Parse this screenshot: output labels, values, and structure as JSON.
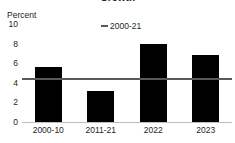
{
  "figure": {
    "title_partial": "Growth",
    "axis_unit_label": "Percent",
    "legend": [
      {
        "label": "2000-21",
        "marker": "horizontal-line-marker",
        "color": "#58595b"
      }
    ]
  },
  "chart_data": {
    "type": "bar",
    "title": "Growth",
    "xlabel": "",
    "ylabel": "Percent",
    "ylim": [
      0,
      10
    ],
    "yticks": [
      0,
      2,
      4,
      6,
      8,
      10
    ],
    "ytick_labels": [
      "0",
      "2",
      "4",
      "6",
      "8",
      "10"
    ],
    "grid": false,
    "legend_position": "top-center",
    "categories": [
      "2000-10",
      "2011-21",
      "2022",
      "2023"
    ],
    "series": [
      {
        "name": "Percent",
        "type": "bar",
        "color": "#000000",
        "values": [
          5.6,
          3.2,
          8.0,
          6.8
        ]
      },
      {
        "name": "2000-21",
        "type": "reference-line",
        "color": "#58595b",
        "value": 4.3
      }
    ]
  }
}
